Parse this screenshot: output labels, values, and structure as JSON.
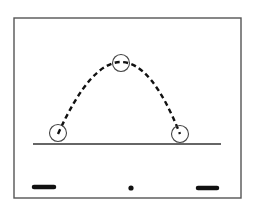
{
  "diagram": {
    "title": "",
    "colors": {
      "background": "#ffffff",
      "frame": "#555555",
      "ink": "#111111",
      "circle": "#444444"
    },
    "frame": {
      "x": 14,
      "y": 18,
      "width": 227,
      "height": 180
    },
    "ground": {
      "x1": 33,
      "y1": 144,
      "x2": 221,
      "y2": 144
    },
    "trajectory": {
      "style": "dashed",
      "points": [
        {
          "label": "launch",
          "x": 58,
          "y": 134
        },
        {
          "label": "peak",
          "x": 121,
          "y": 62
        },
        {
          "label": "landing",
          "x": 180,
          "y": 134
        }
      ]
    },
    "balls": [
      {
        "name": "ball-launch",
        "cx": 58,
        "cy": 133,
        "r": 8.5
      },
      {
        "name": "ball-peak",
        "cx": 121,
        "cy": 63,
        "r": 8.5
      },
      {
        "name": "ball-landing",
        "cx": 180,
        "cy": 134,
        "r": 8.5
      }
    ],
    "markers": [
      {
        "name": "left-bar",
        "shape": "bar",
        "x1": 34,
        "x2": 54,
        "y": 187
      },
      {
        "name": "center-dot",
        "shape": "dot",
        "cx": 131,
        "cy": 188,
        "r": 2.6
      },
      {
        "name": "right-bar",
        "shape": "bar",
        "x1": 198,
        "x2": 217,
        "y": 188
      }
    ]
  }
}
